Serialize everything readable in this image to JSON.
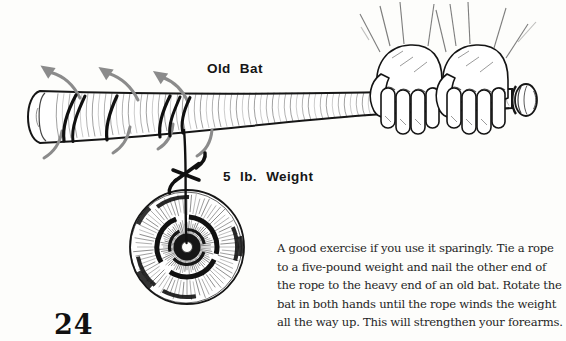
{
  "page": {
    "number": "24",
    "background": "#fdfdfb",
    "ink_color": "#161616",
    "arrow_color": "#8b8b8b"
  },
  "illustration": {
    "bat_label": "Old Bat",
    "weight_label": "5 lb. Weight",
    "description": "Hand-drawn old baseball bat gripped by two hands at the handle; a rope wound around the barrel hangs down to a round five-pound plate weight; gray curved arrows show the rotation of the bat"
  },
  "caption": {
    "lines": [
      "A good exercise if you use it sparingly. Tie a rope",
      "to a five-pound weight and nail the other end of",
      "the rope to the heavy end of an old bat. Rotate the",
      "bat in both hands until the rope winds the weight",
      "all the way up. This will strengthen your forearms."
    ]
  }
}
